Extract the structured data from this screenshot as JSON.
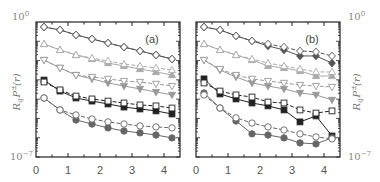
{
  "chart_data": [
    {
      "type": "line",
      "panel_label": "(a)",
      "xlabel": "",
      "ylabel": "R_q P_q^±(r)",
      "ylabel_side": "left",
      "yscale": "log",
      "ylim": [
        1e-07,
        1
      ],
      "xlim": [
        0,
        4.5
      ],
      "y_tick_labels": [
        "10^0",
        "10^-7"
      ],
      "x_tick_labels": [
        "0",
        "1",
        "2",
        "3",
        "4"
      ],
      "x": [
        0.25,
        0.75,
        1.25,
        1.75,
        2.25,
        2.75,
        3.25,
        3.75,
        4.25
      ],
      "series_log10": [
        {
          "name": "filled diamond",
          "marker": "diamond",
          "filled": true,
          "color": "#555555",
          "dashed": false,
          "values": [
            -0.26,
            -0.41,
            -0.67,
            -0.88,
            -1.09,
            -1.3,
            -1.5,
            -1.71,
            -1.92
          ]
        },
        {
          "name": "open diamond",
          "marker": "diamond",
          "filled": false,
          "color": "#555555",
          "dashed": true,
          "values": [
            -0.26,
            -0.41,
            -0.67,
            -0.88,
            -1.09,
            -1.3,
            -1.5,
            -1.71,
            -1.92
          ]
        },
        {
          "name": "filled triangle up",
          "marker": "triangle-up",
          "filled": true,
          "color": "#aaaaaa",
          "dashed": false,
          "values": [
            -1.14,
            -1.45,
            -1.71,
            -1.92,
            -2.13,
            -2.28,
            -2.44,
            -2.59,
            -2.75
          ]
        },
        {
          "name": "open triangle up",
          "marker": "triangle-up",
          "filled": false,
          "color": "#aaaaaa",
          "dashed": true,
          "values": [
            -1.14,
            -1.45,
            -1.71,
            -1.87,
            -2.02,
            -2.18,
            -2.28,
            -2.38,
            -2.49
          ]
        },
        {
          "name": "filled triangle down",
          "marker": "triangle-down",
          "filled": true,
          "color": "#999999",
          "dashed": false,
          "values": [
            -1.97,
            -2.38,
            -2.75,
            -2.95,
            -3.16,
            -3.32,
            -3.47,
            -3.63,
            -3.78
          ]
        },
        {
          "name": "open triangle down",
          "marker": "triangle-down",
          "filled": false,
          "color": "#999999",
          "dashed": true,
          "values": [
            -1.97,
            -2.38,
            -2.75,
            -2.85,
            -2.95,
            -3.06,
            -3.11,
            -3.21,
            -3.32
          ]
        },
        {
          "name": "filled square",
          "marker": "square",
          "filled": true,
          "color": "#222222",
          "dashed": false,
          "values": [
            -3.01,
            -3.58,
            -3.94,
            -4.1,
            -4.25,
            -4.41,
            -4.51,
            -4.61,
            -4.77
          ]
        },
        {
          "name": "open square",
          "marker": "square",
          "filled": false,
          "color": "#222222",
          "dashed": true,
          "values": [
            -3.11,
            -3.52,
            -3.84,
            -3.99,
            -4.1,
            -4.2,
            -4.3,
            -4.35,
            -4.46
          ]
        },
        {
          "name": "filled circle",
          "marker": "circle",
          "filled": true,
          "color": "#666666",
          "dashed": false,
          "values": [
            -3.94,
            -4.56,
            -5.08,
            -5.29,
            -5.49,
            -5.65,
            -5.75,
            -5.86,
            -6.01
          ]
        },
        {
          "name": "open circle",
          "marker": "circle",
          "filled": false,
          "color": "#666666",
          "dashed": true,
          "values": [
            -3.94,
            -4.56,
            -4.82,
            -5.03,
            -5.18,
            -5.29,
            -5.39,
            -5.44,
            -5.49
          ]
        }
      ]
    },
    {
      "type": "line",
      "panel_label": "(b)",
      "xlabel": "",
      "ylabel": "R_q P_q^±(r)",
      "ylabel_side": "right",
      "yscale": "log",
      "ylim": [
        1e-07,
        1
      ],
      "xlim": [
        0,
        4.5
      ],
      "y_tick_labels": [
        "10^0",
        "10^-7"
      ],
      "x_tick_labels": [
        "0",
        "1",
        "2",
        "3",
        "4"
      ],
      "x": [
        0.25,
        0.75,
        1.25,
        1.75,
        2.25,
        2.75,
        3.25,
        3.75,
        4.25
      ],
      "series_log10": [
        {
          "name": "filled diamond",
          "marker": "diamond",
          "filled": true,
          "color": "#555555",
          "dashed": false,
          "values": [
            -0.26,
            -0.41,
            -0.72,
            -0.98,
            -1.24,
            -1.45,
            -1.76,
            -1.76,
            -2.13
          ]
        },
        {
          "name": "open diamond",
          "marker": "diamond",
          "filled": false,
          "color": "#555555",
          "dashed": true,
          "values": [
            -0.26,
            -0.41,
            -0.72,
            -0.98,
            -1.14,
            -1.3,
            -1.5,
            -1.55,
            -1.76
          ]
        },
        {
          "name": "filled triangle up",
          "marker": "triangle-up",
          "filled": true,
          "color": "#aaaaaa",
          "dashed": false,
          "values": [
            -1.14,
            -1.45,
            -1.71,
            -1.97,
            -2.28,
            -2.38,
            -2.54,
            -2.8,
            -2.8
          ]
        },
        {
          "name": "open triangle up",
          "marker": "triangle-up",
          "filled": false,
          "color": "#aaaaaa",
          "dashed": true,
          "values": [
            -1.14,
            -1.45,
            -1.71,
            -1.92,
            -2.13,
            -2.28,
            -2.44,
            -2.59,
            -2.59
          ]
        },
        {
          "name": "filled triangle down",
          "marker": "triangle-down",
          "filled": true,
          "color": "#999999",
          "dashed": false,
          "values": [
            -1.97,
            -2.49,
            -2.85,
            -3.16,
            -3.32,
            -3.47,
            -3.68,
            -3.78,
            -4.04
          ]
        },
        {
          "name": "open triangle down",
          "marker": "triangle-down",
          "filled": false,
          "color": "#999999",
          "dashed": true,
          "values": [
            -1.97,
            -2.44,
            -2.75,
            -2.95,
            -3.06,
            -3.16,
            -3.27,
            -3.32,
            -3.37
          ]
        },
        {
          "name": "filled square",
          "marker": "square",
          "filled": true,
          "color": "#222222",
          "dashed": false,
          "values": [
            -2.95,
            -3.73,
            -3.99,
            -4.2,
            -4.35,
            -4.56,
            -5.18,
            -4.87,
            -5.91
          ]
        },
        {
          "name": "open square",
          "marker": "square",
          "filled": false,
          "color": "#222222",
          "dashed": true,
          "values": [
            -3.16,
            -3.58,
            -3.78,
            -3.89,
            -4.15,
            -4.2,
            -4.56,
            -4.72,
            -4.61
          ]
        },
        {
          "name": "filled circle",
          "marker": "circle",
          "filled": true,
          "color": "#666666",
          "dashed": false,
          "values": [
            -3.68,
            -4.46,
            -5.13,
            -5.8,
            -5.86,
            -6.01,
            -6.27,
            -6.32,
            -6.01
          ]
        },
        {
          "name": "open circle",
          "marker": "circle",
          "filled": false,
          "color": "#666666",
          "dashed": true,
          "values": [
            -3.78,
            -4.46,
            -4.97,
            -5.24,
            -5.44,
            -5.6,
            -5.8,
            -5.96,
            -6.06
          ]
        }
      ]
    }
  ],
  "labels": {
    "panel_a": "(a)",
    "panel_b": "(b)",
    "y_top": "10",
    "y_top_exp": "0",
    "y_bottom": "10",
    "y_bottom_exp": "−7",
    "ylabel_main": "R",
    "ylabel_q": "q",
    "ylabel_P": "P",
    "ylabel_pm": "±",
    "ylabel_q2": "q",
    "ylabel_r": "(r)",
    "x_ticks": [
      "0",
      "1",
      "2",
      "3",
      "4"
    ]
  }
}
